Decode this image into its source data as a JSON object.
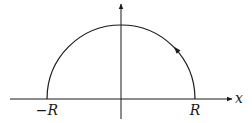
{
  "diagram": {
    "colors": {
      "stroke": "#1a1a1a",
      "background": "#ffffff"
    },
    "axes": {
      "x_axis": {
        "label": "x",
        "y": 99,
        "x_start": 10,
        "x_end": 232
      },
      "y_axis": {
        "label": "",
        "x": 121,
        "y_start": 119,
        "y_end": 4
      }
    },
    "contour": {
      "type": "semicircle",
      "center": [
        121,
        99
      ],
      "radius": 74,
      "orientation": "counterclockwise",
      "direction_arrow_at": [
        176,
        49
      ]
    },
    "labels": {
      "neg_r": "−R",
      "pos_r": "R",
      "x_axis": "x"
    }
  }
}
